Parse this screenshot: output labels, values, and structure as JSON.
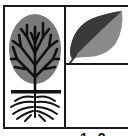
{
  "figure": {
    "cells": [
      {
        "id": "tree",
        "icon": "tree-with-roots-icon",
        "description": "Deciduous tree with grey canopy, black branches and spreading roots"
      },
      {
        "id": "leaf",
        "icon": "leaf-icon",
        "description": "Leaf, dark upper half and grey lower half"
      },
      {
        "id": "empty",
        "icon": null
      }
    ],
    "colors": {
      "border": "#1a1a1a",
      "canopy": "#7a7a7a",
      "branches": "#111111",
      "leaf_dark": "#3a3a3a",
      "leaf_light": "#8a8a8a"
    },
    "bottom_text": "1 2"
  }
}
